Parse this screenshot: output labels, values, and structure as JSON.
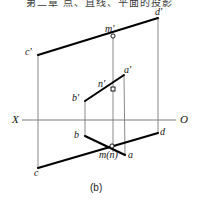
{
  "header": {
    "cjk_text": "第二章 点、直线、平面的投影"
  },
  "figure": {
    "caption": "(b)",
    "type": "descriptive-geometry-orthographic-projection",
    "axis": {
      "left_label": "X",
      "right_label": "O",
      "y": 120,
      "x_start": 22,
      "x_end": 176
    },
    "colors": {
      "stroke": "#000000",
      "thin_stroke": "#7d7d7d",
      "background": "#ffffff",
      "marker_fill": "#ffffff"
    },
    "points": [
      {
        "id": "c-prime",
        "label": "c'",
        "x": 38,
        "y": 55,
        "label_x": 25,
        "label_y": 47,
        "marker": "none"
      },
      {
        "id": "d-prime",
        "label": "d'",
        "x": 158,
        "y": 18,
        "label_x": 155,
        "label_y": 7,
        "marker": "none"
      },
      {
        "id": "m-prime",
        "label": "m'",
        "x": 113,
        "y": 36,
        "label_x": 105,
        "label_y": 24,
        "marker": "circle"
      },
      {
        "id": "a-prime",
        "label": "a'",
        "x": 124,
        "y": 75,
        "label_x": 124,
        "label_y": 65,
        "marker": "none"
      },
      {
        "id": "n-prime",
        "label": "n'",
        "x": 113,
        "y": 89,
        "label_x": 98,
        "label_y": 79,
        "marker": "square"
      },
      {
        "id": "b-prime",
        "label": "b'",
        "x": 85,
        "y": 101,
        "label_x": 72,
        "label_y": 93,
        "marker": "none"
      },
      {
        "id": "b",
        "label": "b",
        "x": 85,
        "y": 136,
        "label_x": 74,
        "label_y": 130,
        "marker": "none"
      },
      {
        "id": "d",
        "label": "d",
        "x": 158,
        "y": 133,
        "label_x": 160,
        "label_y": 127,
        "marker": "none"
      },
      {
        "id": "mn",
        "label": "m(n)",
        "x": 112,
        "y": 146,
        "label_x": 99,
        "label_y": 150,
        "marker": "circle"
      },
      {
        "id": "a",
        "label": "a",
        "x": 125,
        "y": 155,
        "label_x": 128,
        "label_y": 150,
        "marker": "none"
      },
      {
        "id": "c",
        "label": "c",
        "x": 38,
        "y": 168,
        "label_x": 34,
        "label_y": 168,
        "marker": "none"
      }
    ],
    "thick_segments": [
      {
        "name": "cprime-dprime",
        "x1": 38,
        "y1": 55,
        "x2": 158,
        "y2": 18
      },
      {
        "name": "c-d",
        "x1": 38,
        "y1": 168,
        "x2": 158,
        "y2": 133
      },
      {
        "name": "bprime-aprime",
        "x1": 85,
        "y1": 101,
        "x2": 124,
        "y2": 75
      },
      {
        "name": "b-a",
        "x1": 85,
        "y1": 136,
        "x2": 125,
        "y2": 155
      }
    ],
    "thin_segments": [
      {
        "name": "cprime-c-vertical",
        "x1": 38,
        "y1": 55,
        "x2": 38,
        "y2": 168
      },
      {
        "name": "dprime-d-vertical",
        "x1": 158,
        "y1": 18,
        "x2": 158,
        "y2": 133
      },
      {
        "name": "mprime-mn-vertical",
        "x1": 113,
        "y1": 36,
        "x2": 113,
        "y2": 152
      },
      {
        "name": "bprime-b-vertical",
        "x1": 85,
        "y1": 101,
        "x2": 85,
        "y2": 136
      },
      {
        "name": "aprime-a-vertical",
        "x1": 124,
        "y1": 75,
        "x2": 125,
        "y2": 155
      }
    ]
  }
}
